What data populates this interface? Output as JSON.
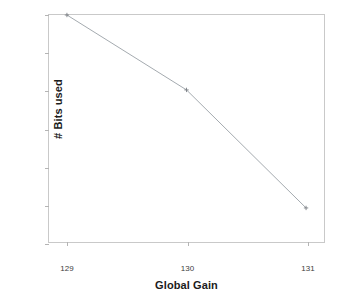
{
  "chart_data": {
    "type": "line",
    "title": "",
    "xlabel": "Global Gain",
    "ylabel": "# Bits used",
    "x": [
      129,
      130,
      131
    ],
    "values": [
      1700,
      1601,
      1445
    ],
    "series": [
      {
        "name": "# Bits used",
        "values": [
          1700,
          1601,
          1445
        ]
      }
    ],
    "xlim": [
      128.85,
      131.15
    ],
    "ylim": [
      1400,
      1700
    ],
    "xticks": [
      "129",
      "130",
      "131"
    ],
    "yticks": [
      "1400",
      "1450",
      "1500",
      "1550",
      "1600",
      "1650",
      "1700"
    ],
    "xtick_values": [
      129,
      130,
      131
    ],
    "ytick_values": [
      1400,
      1450,
      1500,
      1550,
      1600,
      1650,
      1700
    ],
    "grid": false,
    "legend": null,
    "marker": "plus",
    "line_color": "#9aa0a6",
    "marker_color": "#7a7f85",
    "frame_color": "#c9c9c9",
    "background": "#ffffff",
    "text_color": "#3d3d3d"
  }
}
